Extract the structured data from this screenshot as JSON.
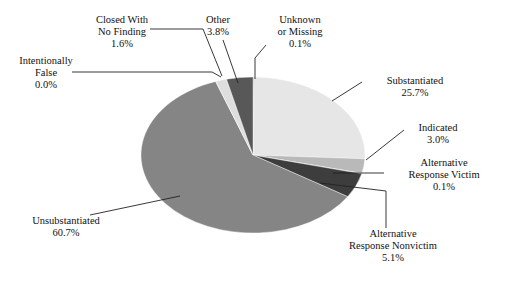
{
  "figure": {
    "background_color": "#ffffff",
    "width": 514,
    "height": 282
  },
  "chart_data": {
    "type": "pie",
    "title": "",
    "subtitle": "",
    "xlabel": "",
    "ylabel": "",
    "legend_position": "none",
    "grid": false,
    "units": "percent",
    "start_angle_deg": 0,
    "direction": "clockwise",
    "center_px": [
      253,
      155
    ],
    "radius_x_px": 112,
    "radius_y_px": 78,
    "categories": [
      "Unknown or Missing",
      "Substantiated",
      "Indicated",
      "Alternative Response Victim",
      "Alternative Response Nonvictim",
      "Unsubstantiated",
      "Intentionally False",
      "Closed With No Finding",
      "Other"
    ],
    "values": [
      0.1,
      25.7,
      3.0,
      0.1,
      5.1,
      60.7,
      0.0,
      1.6,
      3.8
    ],
    "value_labels": [
      "0.1%",
      "25.7%",
      "3.0%",
      "0.1%",
      "5.1%",
      "60.7%",
      "0.0%",
      "1.6%",
      "3.8%"
    ],
    "colors": [
      "#1a1a1a",
      "#e6e6e6",
      "#b9b9b9",
      "#9a9a9a",
      "#3d3d3d",
      "#858585",
      "#cfcfcf",
      "#dedede",
      "#585858"
    ],
    "slices": [
      {
        "name": "Unknown or Missing",
        "value": 0.1,
        "value_label": "0.1%",
        "color": "#1a1a1a",
        "label_lines": [
          "Unknown",
          "or Missing"
        ]
      },
      {
        "name": "Substantiated",
        "value": 25.7,
        "value_label": "25.7%",
        "color": "#e6e6e6",
        "label_lines": [
          "Substantiated"
        ]
      },
      {
        "name": "Indicated",
        "value": 3.0,
        "value_label": "3.0%",
        "color": "#b9b9b9",
        "label_lines": [
          "Indicated"
        ]
      },
      {
        "name": "Alternative Response Victim",
        "value": 0.1,
        "value_label": "0.1%",
        "color": "#9a9a9a",
        "label_lines": [
          "Alternative",
          "Response Victim"
        ]
      },
      {
        "name": "Alternative Response Nonvictim",
        "value": 5.1,
        "value_label": "5.1%",
        "color": "#3d3d3d",
        "label_lines": [
          "Alternative",
          "Response Nonvictim"
        ]
      },
      {
        "name": "Unsubstantiated",
        "value": 60.7,
        "value_label": "60.7%",
        "color": "#858585",
        "label_lines": [
          "Unsubstantiated"
        ]
      },
      {
        "name": "Intentionally False",
        "value": 0.0,
        "value_label": "0.0%",
        "color": "#cfcfcf",
        "label_lines": [
          "Intentionally",
          "False"
        ]
      },
      {
        "name": "Closed With No Finding",
        "value": 1.6,
        "value_label": "1.6%",
        "color": "#dedede",
        "label_lines": [
          "Closed With",
          "No Finding"
        ]
      },
      {
        "name": "Other",
        "value": 3.8,
        "value_label": "3.8%",
        "color": "#585858",
        "label_lines": [
          "Other"
        ]
      }
    ]
  },
  "labels": {
    "closed_with_no_finding": {
      "line1": "Closed With",
      "line2": "No Finding",
      "value": "1.6%"
    },
    "other": {
      "line1": "Other",
      "value": "3.8%"
    },
    "unknown_or_missing": {
      "line1": "Unknown",
      "line2": "or Missing",
      "value": "0.1%"
    },
    "intentionally_false": {
      "line1": "Intentionally",
      "line2": "False",
      "value": "0.0%"
    },
    "substantiated": {
      "line1": "Substantiated",
      "value": "25.7%"
    },
    "indicated": {
      "line1": "Indicated",
      "value": "3.0%"
    },
    "alternative_response_victim": {
      "line1": "Alternative",
      "line2": "Response Victim",
      "value": "0.1%"
    },
    "alternative_response_nonvictim": {
      "line1": "Alternative",
      "line2": "Response Nonvictim",
      "value": "5.1%"
    },
    "unsubstantiated": {
      "line1": "Unsubstantiated",
      "value": "60.7%"
    }
  }
}
